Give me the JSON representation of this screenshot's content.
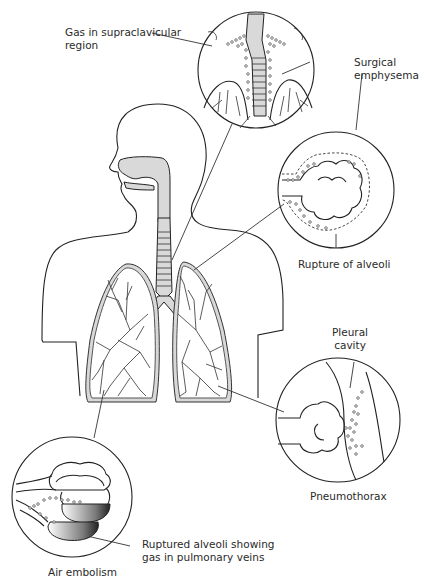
{
  "figure": {
    "labels": {
      "supraclavicular": [
        "Gas in supraclavicular",
        "region"
      ],
      "surgical_emphysema": [
        "Surgical",
        "emphysema"
      ],
      "rupture_alveoli": "Rupture of alveoli",
      "pleural_cavity": [
        "Pleural",
        "cavity"
      ],
      "pneumothorax": "Pneumothorax",
      "ruptured_alveoli_veins": [
        "Ruptured alveoli showing",
        "gas in pulmonary veins"
      ],
      "air_embolism": "Air embolism"
    },
    "insets": [
      {
        "name": "supraclavicular-inset",
        "cx": 256,
        "cy": 70,
        "r": 58
      },
      {
        "name": "alveoli-rupture-inset",
        "cx": 336,
        "cy": 190,
        "r": 58
      },
      {
        "name": "pneumothorax-inset",
        "cx": 338,
        "cy": 420,
        "r": 62
      },
      {
        "name": "air-embolism-inset",
        "cx": 72,
        "cy": 497,
        "r": 60
      }
    ],
    "colors": {
      "line": "#222222",
      "airway_fill": "#d9d9d9",
      "background": "#ffffff"
    }
  }
}
